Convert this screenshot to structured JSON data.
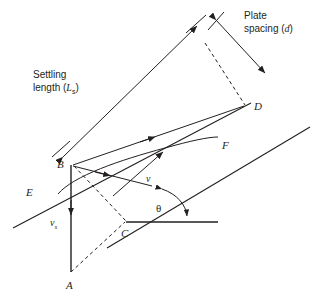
{
  "figure": {
    "title_text": "",
    "annotations": {
      "settling_length": "Settling\nlength (Lₛ)",
      "settling_length_line1": "Settling",
      "settling_length_line2_prefix": "length (",
      "settling_length_symbol": "L",
      "settling_length_subscript": "s",
      "settling_length_line2_suffix": ")",
      "plate_spacing_line1": "Plate",
      "plate_spacing_line2_prefix": "spacing (",
      "plate_spacing_symbol": "d",
      "plate_spacing_line2_suffix": ")",
      "velocity_symbol": "v",
      "settling_velocity_symbol": "v",
      "settling_velocity_subscript": "s",
      "angle_symbol": "θ"
    },
    "points": {
      "A": "A",
      "B": "B",
      "C": "C",
      "D": "D",
      "E": "E",
      "F": "F"
    },
    "colors": {
      "stroke": "#231f20",
      "background": "#ffffff",
      "text": "#231f20"
    },
    "geometry": {
      "plate_angle_deg": 40,
      "lower_plate_start": [
        13,
        228
      ],
      "lower_plate_end": [
        251,
        103
      ],
      "upper_plate_start": [
        107,
        248
      ],
      "upper_plate_end": [
        308,
        128
      ],
      "point_B": [
        72,
        163
      ],
      "point_C": [
        126,
        222
      ],
      "point_A": [
        70,
        277
      ],
      "point_D": [
        245,
        106
      ],
      "point_E": [
        48,
        189
      ],
      "point_F": [
        215,
        143
      ],
      "baseline_start": [
        126,
        222
      ],
      "baseline_end": [
        218,
        222
      ]
    }
  }
}
